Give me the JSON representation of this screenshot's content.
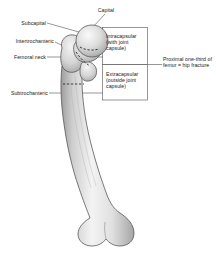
{
  "figure": {
    "bone_color_light": "#fdfdfd",
    "bone_color_mid": "#d9d9d9",
    "bone_color_shadow": "#a8a8a8",
    "outline_color": "#4a4a4a",
    "line_color": "#555555",
    "text_color": "#1a1a1a"
  },
  "labels": {
    "capital": "Capital",
    "subcapital": "Subcapital",
    "intertrochanteric": "Intertrochanteric",
    "femoral_neck": "Femoral neck",
    "subtrochanteric": "Subtrochanteric",
    "intracapsular": "Intracapsular (with joint capsule)",
    "extracapsular": "Extracapsular (outside joint capsule)",
    "proximal": "Proximal one-third of femur = hip fracture"
  }
}
